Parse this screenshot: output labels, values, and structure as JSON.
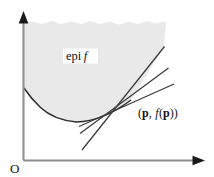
{
  "figure": {
    "type": "math-diagram",
    "background_color": "#ffffff",
    "width": 214,
    "height": 177
  },
  "axes": {
    "origin_label": "O",
    "y_axis": {
      "name": "vertical-axis",
      "x": 23,
      "y_top": 14,
      "y_bottom": 160,
      "color": "#8e8e8e",
      "arrow": "up"
    },
    "x_axis": {
      "name": "horizontal-axis",
      "y": 160,
      "x_left": 23,
      "x_right": 205,
      "color": "#8e8e8e",
      "arrow": "right"
    }
  },
  "region": {
    "label_text_roman": "epi",
    "label_text_italic": "f",
    "label_x": 66,
    "label_y": 60,
    "fill_color": "#e9e9e9",
    "top_edge_style": "ragged",
    "description": "shaded epigraph region above the curve"
  },
  "curve": {
    "name": "convex-function-curve",
    "color": "#2b2b2b",
    "stroke_width": 1.5,
    "points": [
      [
        24,
        88
      ],
      [
        34,
        101
      ],
      [
        46,
        112
      ],
      [
        60,
        119
      ],
      [
        76,
        122
      ],
      [
        92,
        121
      ],
      [
        108,
        116
      ],
      [
        120,
        110
      ],
      [
        131,
        100
      ]
    ]
  },
  "tangent_point": {
    "name": "point-p",
    "x": 131,
    "y": 100,
    "label_open": "(",
    "label_p1": "p",
    "label_comma": ", ",
    "label_f": "f",
    "label_paren_open": "(",
    "label_p2": "p",
    "label_paren_close": ")",
    "label_close": ")",
    "label_x": 138,
    "label_y": 117
  },
  "tangent_lines": [
    {
      "name": "tangent-line-shallow",
      "x1": 79,
      "y1": 126,
      "x2": 174,
      "y2": 84,
      "color": "#3a3a3a"
    },
    {
      "name": "tangent-line-medium",
      "x1": 80,
      "y1": 133,
      "x2": 168,
      "y2": 68,
      "color": "#3a3a3a"
    },
    {
      "name": "tangent-line-steep",
      "x1": 82,
      "y1": 150,
      "x2": 164,
      "y2": 47,
      "color": "#3a3a3a"
    }
  ]
}
